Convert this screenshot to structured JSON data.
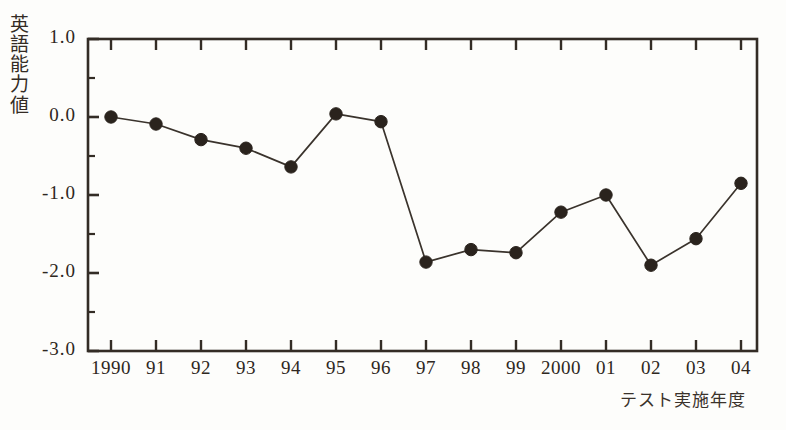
{
  "chart_data": {
    "type": "line",
    "title": "",
    "xlabel": "テスト実施年度",
    "ylabel": "英語能力値",
    "categories": [
      "1990",
      "91",
      "92",
      "93",
      "94",
      "95",
      "96",
      "97",
      "98",
      "99",
      "2000",
      "01",
      "02",
      "03",
      "04"
    ],
    "values": [
      0.0,
      -0.09,
      -0.29,
      -0.4,
      -0.64,
      0.04,
      -0.06,
      -1.86,
      -1.7,
      -1.74,
      -1.22,
      -1.0,
      -1.9,
      -1.56,
      -0.85
    ],
    "series": [
      {
        "name": "英語能力値",
        "values": [
          0.0,
          -0.09,
          -0.29,
          -0.4,
          -0.64,
          0.04,
          -0.06,
          -1.86,
          -1.7,
          -1.74,
          -1.22,
          -1.0,
          -1.9,
          -1.56,
          -0.85
        ]
      }
    ],
    "ylim": [
      -3.0,
      1.0
    ],
    "ytick_labels": [
      "1.0",
      "0.0",
      "-1.0",
      "-2.0",
      "-3.0"
    ],
    "ytick_values": [
      1.0,
      0.0,
      -1.0,
      -2.0,
      -3.0
    ],
    "yminor_values": [
      0.5,
      -0.5,
      -1.5,
      -2.5
    ],
    "grid": false,
    "legend": "none",
    "marker": "filled-circle",
    "colors": {
      "line": "#3a332c",
      "marker": "#2a231d",
      "axis": "#332c25",
      "background": "#fdfdfb"
    }
  },
  "ylabel_chars": [
    "英",
    "語",
    "能",
    "力",
    "値"
  ]
}
